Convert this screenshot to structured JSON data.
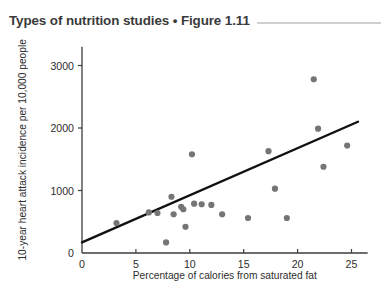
{
  "header": {
    "title": "Types of nutrition studies • Figure 1.11",
    "rule": "horizontal-rule"
  },
  "chart_data": {
    "type": "scatter",
    "title": "Types of nutrition studies • Figure 1.11",
    "xlabel": "Percentage of calories from saturated fat",
    "ylabel": "10-year heart attack incidence per 10,000 people",
    "xlim": [
      0,
      26.5
    ],
    "ylim": [
      0,
      3300
    ],
    "xticks": [
      0,
      5,
      10,
      15,
      20,
      25
    ],
    "xtick_labels": [
      "0",
      "5",
      "10",
      "15",
      "20",
      "25"
    ],
    "yticks": [
      0,
      1000,
      2000,
      3000
    ],
    "ytick_labels": [
      "0",
      "1000",
      "2000",
      "3000"
    ],
    "grid": false,
    "legend": "none",
    "point_color": "#757575",
    "line_color": "#111111",
    "points": [
      {
        "x": 3.2,
        "y": 480
      },
      {
        "x": 6.2,
        "y": 650
      },
      {
        "x": 7.0,
        "y": 640
      },
      {
        "x": 7.8,
        "y": 170
      },
      {
        "x": 8.3,
        "y": 900
      },
      {
        "x": 8.5,
        "y": 620
      },
      {
        "x": 9.2,
        "y": 740
      },
      {
        "x": 9.4,
        "y": 700
      },
      {
        "x": 9.6,
        "y": 420
      },
      {
        "x": 10.2,
        "y": 1580
      },
      {
        "x": 10.4,
        "y": 790
      },
      {
        "x": 11.1,
        "y": 780
      },
      {
        "x": 12.0,
        "y": 770
      },
      {
        "x": 13.0,
        "y": 620
      },
      {
        "x": 15.4,
        "y": 560
      },
      {
        "x": 17.3,
        "y": 1630
      },
      {
        "x": 17.9,
        "y": 1030
      },
      {
        "x": 19.0,
        "y": 560
      },
      {
        "x": 21.5,
        "y": 2780
      },
      {
        "x": 21.9,
        "y": 1990
      },
      {
        "x": 22.4,
        "y": 1380
      },
      {
        "x": 24.6,
        "y": 1720
      }
    ],
    "trendline": {
      "label": "best-fit-line",
      "x_start": 0.0,
      "y_start": 170,
      "x_end": 25.6,
      "y_end": 2100
    }
  }
}
